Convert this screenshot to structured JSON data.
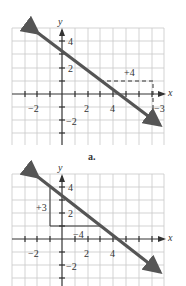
{
  "figures": [
    {
      "id": "a",
      "caption": "a.",
      "axis_labels": {
        "x": "x",
        "y": "y"
      },
      "ticks": {
        "x_neg2": "−2",
        "x_2": "2",
        "x_4": "4",
        "y_4": "4",
        "y_2": "2",
        "y_neg2": "−2"
      },
      "annotations": {
        "run": "+4",
        "rise": "−3"
      },
      "line": {
        "from": [
          -2,
          4.5
        ],
        "to": [
          6.5,
          -2
        ]
      }
    },
    {
      "id": "b",
      "caption": "",
      "axis_labels": {
        "x": "x",
        "y": "y"
      },
      "ticks": {
        "x_neg2": "−2",
        "x_2": "2",
        "x_4": "4",
        "y_4": "4",
        "y_2": "2",
        "y_neg2": "−2"
      },
      "annotations": {
        "rise": "+3",
        "run": "−4"
      },
      "line": {
        "from": [
          -2,
          4.5
        ],
        "to": [
          6.5,
          -2
        ]
      }
    }
  ],
  "colors": {
    "grid": "#c8c8c8",
    "axis": "#333333",
    "line": "#555555"
  }
}
